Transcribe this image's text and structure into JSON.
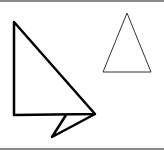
{
  "diagram": {
    "background": "#ffffff",
    "border_color": "#8a8a8a",
    "shapes": [
      {
        "name": "large-right-triangle-with-tail",
        "stroke": "#000000",
        "stroke_width": 2.5,
        "points": "14,22 14,115 95,114",
        "tail_points": "66,115 52,137 95,114"
      },
      {
        "name": "small-isosceles-triangle",
        "stroke": "#333333",
        "stroke_width": 1,
        "points": "127,13 103,72 151,72"
      }
    ]
  }
}
